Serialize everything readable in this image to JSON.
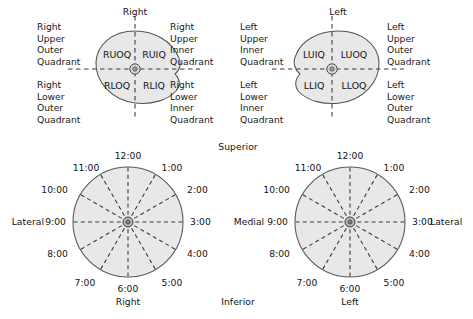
{
  "figure": {
    "title_hidden": "Breast quadrant and clock-face localization diagram",
    "colors": {
      "breast_fill": "#e8e8e8",
      "breast_stroke": "#555555",
      "dashed_stroke": "#4a4a4a",
      "text": "#141414",
      "background": "#ffffff"
    }
  },
  "top_left_quadrant_diagram": {
    "heading": "Right",
    "abbreviations": {
      "upper_outer": "RUOQ",
      "upper_inner": "RUIQ",
      "lower_outer": "RLOQ",
      "lower_inner": "RLIQ"
    },
    "left_caption_upper": [
      "Right",
      "Upper",
      "Outer",
      "Quadrant"
    ],
    "left_caption_lower": [
      "Right",
      "Lower",
      "Outer",
      "Quadrant"
    ],
    "right_caption_upper": [
      "Right",
      "Upper",
      "Inner",
      "Quadrant"
    ],
    "right_caption_lower": [
      "Right",
      "Lower",
      "Inner",
      "Quadrant"
    ]
  },
  "top_right_quadrant_diagram": {
    "heading": "Left",
    "abbreviations": {
      "upper_inner": "LUIQ",
      "upper_outer": "LUOQ",
      "lower_inner": "LLIQ",
      "lower_outer": "LLOQ"
    },
    "left_caption_upper": [
      "Left",
      "Upper",
      "Inner",
      "Quadrant"
    ],
    "left_caption_lower": [
      "Left",
      "Lower",
      "Inner",
      "Quadrant"
    ],
    "right_caption_upper": [
      "Left",
      "Upper",
      "Outer",
      "Quadrant"
    ],
    "right_caption_lower": [
      "Left",
      "Lower",
      "Outer",
      "Quadrant"
    ]
  },
  "orientation": {
    "superior": "Superior",
    "inferior": "Inferior",
    "lateral_far_left": "Lateral",
    "medial_center": "Medial",
    "lateral_far_right": "Lateral"
  },
  "bottom_left_clock": {
    "caption": "Right",
    "hours": [
      "12:00",
      "1:00",
      "2:00",
      "3:00",
      "4:00",
      "5:00",
      "6:00",
      "7:00",
      "8:00",
      "9:00",
      "10:00",
      "11:00"
    ],
    "side_label_left": "Lateral",
    "side_label_right": "Medial"
  },
  "bottom_right_clock": {
    "caption": "Left",
    "hours": [
      "12:00",
      "1:00",
      "2:00",
      "3:00",
      "4:00",
      "5:00",
      "6:00",
      "7:00",
      "8:00",
      "9:00",
      "10:00",
      "11:00"
    ],
    "side_label_left": "Medial",
    "side_label_right": "Lateral"
  }
}
